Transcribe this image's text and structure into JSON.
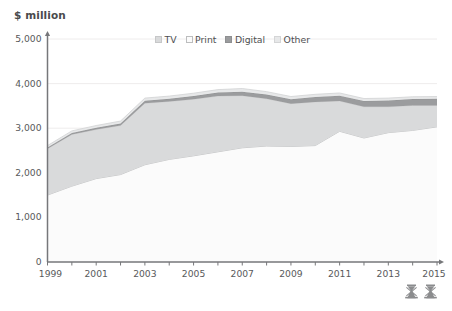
{
  "axis_title": "$ million",
  "legend": {
    "items": [
      {
        "label": "TV",
        "color": "#d9dadb",
        "border": "#c6c7c8"
      },
      {
        "label": "Print",
        "color": "#fbfbfb",
        "border": "#bcbdbe"
      },
      {
        "label": "Digital",
        "color": "#9b9c9e",
        "border": "#8e8f91"
      },
      {
        "label": "Other",
        "color": "#e7e8e9",
        "border": "#d4d5d6"
      }
    ]
  },
  "marks": {
    "left": "mark-left",
    "right": "mark-right"
  },
  "chart_data": {
    "type": "area",
    "stacked": true,
    "title": "",
    "xlabel": "",
    "ylabel": "$ million",
    "ylim": [
      0,
      5000
    ],
    "ytick_values": [
      0,
      1000,
      2000,
      3000,
      4000,
      5000
    ],
    "ytick_labels": [
      "0",
      "1,000",
      "2,000",
      "3,000",
      "4,000",
      "5,000"
    ],
    "xlim": [
      1999,
      2015
    ],
    "x": [
      1999,
      2000,
      2001,
      2002,
      2003,
      2004,
      2005,
      2006,
      2007,
      2008,
      2009,
      2010,
      2011,
      2012,
      2013,
      2014,
      2015
    ],
    "xtick_values": [
      1999,
      2000,
      2001,
      2002,
      2003,
      2004,
      2005,
      2006,
      2007,
      2008,
      2009,
      2010,
      2011,
      2012,
      2013,
      2014,
      2015
    ],
    "xtick_labels_shown": [
      "1999",
      "2001",
      "2003",
      "2005",
      "2007",
      "2009",
      "2011",
      "2013",
      "2015"
    ],
    "grid": "horizontal",
    "legend_position": "top-center",
    "series": [
      {
        "name": "Print",
        "color": "#fbfbfb",
        "values": [
          1500,
          1700,
          1870,
          1960,
          2180,
          2300,
          2380,
          2470,
          2560,
          2600,
          2590,
          2610,
          2930,
          2780,
          2900,
          2950,
          3030
        ]
      },
      {
        "name": "TV",
        "color": "#d9dadb",
        "values": [
          1040,
          1160,
          1100,
          1100,
          1380,
          1300,
          1270,
          1250,
          1170,
          1060,
          960,
          980,
          680,
          700,
          580,
          560,
          480
        ]
      },
      {
        "name": "Digital",
        "color": "#9b9c9e",
        "values": [
          30,
          35,
          40,
          45,
          55,
          60,
          70,
          80,
          90,
          95,
          100,
          110,
          120,
          130,
          140,
          145,
          150
        ]
      },
      {
        "name": "Other",
        "color": "#e7e8e9",
        "values": [
          40,
          45,
          50,
          55,
          60,
          60,
          65,
          65,
          70,
          65,
          60,
          60,
          60,
          55,
          55,
          50,
          50
        ]
      }
    ],
    "totals": [
      2610,
      2940,
      3060,
      3160,
      3675,
      3720,
      3785,
      3865,
      3890,
      3820,
      3710,
      3760,
      3790,
      3665,
      3675,
      3705,
      3710
    ]
  }
}
